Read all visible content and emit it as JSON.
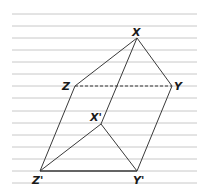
{
  "diagram": {
    "type": "geometric-translation-prism",
    "background": "#ffffff",
    "rule_color": "#c8c8c8",
    "line_color": "#3a3a3a",
    "ruled_lines": {
      "x_start": 12,
      "x_end": 197,
      "y_positions": [
        14,
        26,
        38,
        50,
        62,
        74,
        86,
        98,
        111,
        123,
        135,
        147,
        159,
        171,
        183
      ]
    },
    "points": {
      "X": {
        "label": "X",
        "x": 137,
        "y": 38
      },
      "Y": {
        "label": "Y",
        "x": 172,
        "y": 86
      },
      "Z": {
        "label": "Z",
        "x": 75,
        "y": 86
      },
      "X_prime": {
        "label": "X'",
        "x": 101,
        "y": 124
      },
      "Y_prime": {
        "label": "Y'",
        "x": 137,
        "y": 171
      },
      "Z_prime": {
        "label": "Z'",
        "x": 40,
        "y": 171
      }
    },
    "edges": [
      {
        "from": "X",
        "to": "Z",
        "style": "solid"
      },
      {
        "from": "X",
        "to": "Y",
        "style": "solid"
      },
      {
        "from": "Z",
        "to": "Y",
        "style": "dashed"
      },
      {
        "from": "X",
        "to": "X_prime",
        "style": "solid"
      },
      {
        "from": "Z",
        "to": "Z_prime",
        "style": "solid"
      },
      {
        "from": "Y",
        "to": "Y_prime",
        "style": "solid"
      },
      {
        "from": "X_prime",
        "to": "Z_prime",
        "style": "solid"
      },
      {
        "from": "X_prime",
        "to": "Y_prime",
        "style": "solid"
      },
      {
        "from": "Z_prime",
        "to": "Y_prime",
        "style": "bold"
      }
    ]
  }
}
